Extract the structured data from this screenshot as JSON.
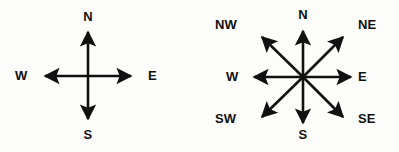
{
  "image": {
    "title": "Compass rose direction diagrams",
    "background_color": "#fdfdfc",
    "stroke_color": "#111111",
    "width": 399,
    "height": 152
  },
  "diagrams": [
    {
      "id": "compass-4point",
      "name": "four-point-compass",
      "caption": "Four cardinal directions",
      "center": {
        "x": 88,
        "y": 76
      },
      "labels": {
        "north": "N",
        "south": "S",
        "east": "E",
        "west": "W"
      },
      "arrows": [
        {
          "direction": "north",
          "angle_deg": 0
        },
        {
          "direction": "east",
          "angle_deg": 90
        },
        {
          "direction": "south",
          "angle_deg": 180
        },
        {
          "direction": "west",
          "angle_deg": 270
        }
      ]
    },
    {
      "id": "compass-8point",
      "name": "eight-point-compass",
      "caption": "Four cardinal and four intercardinal directions",
      "center": {
        "x": 113,
        "y": 77
      },
      "labels": {
        "north": "N",
        "northeast": "NE",
        "east": "E",
        "southeast": "SE",
        "south": "S",
        "southwest": "SW",
        "west": "W",
        "northwest": "NW"
      },
      "arrows": [
        {
          "direction": "north",
          "angle_deg": 0
        },
        {
          "direction": "northeast",
          "angle_deg": 45
        },
        {
          "direction": "east",
          "angle_deg": 90
        },
        {
          "direction": "southeast",
          "angle_deg": 135
        },
        {
          "direction": "south",
          "angle_deg": 180
        },
        {
          "direction": "southwest",
          "angle_deg": 225
        },
        {
          "direction": "west",
          "angle_deg": 270
        },
        {
          "direction": "northwest",
          "angle_deg": 315
        }
      ]
    }
  ]
}
